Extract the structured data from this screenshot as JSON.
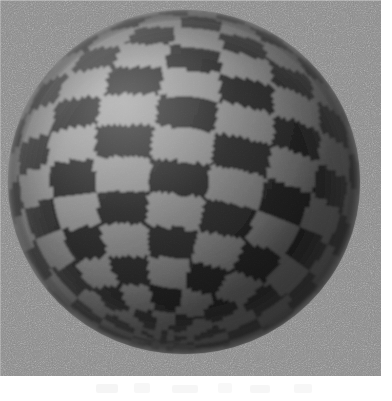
{
  "figure": {
    "media": "grayscale-raster",
    "width_px": 392,
    "height_px": 401
  },
  "plate": {
    "name": "image-plate",
    "left_px": 0,
    "top_px": 0,
    "width_px": 381,
    "height_px": 376,
    "background_color": "#949494",
    "noise": "fine film grain",
    "noise_amplitude": 0.34
  },
  "sphere": {
    "name": "checkerboard-sphere",
    "center_x_px": 184,
    "center_y_px": 182,
    "radius_x_px": 176,
    "radius_y_px": 172,
    "silhouette_color": "#6e6e6e",
    "checker": {
      "type": "spherical-checkerboard",
      "meridian_bands": 18,
      "parallel_bands": 16,
      "dark_color": "#1d1d1d",
      "light_color": "#a6a6a6",
      "mid_color": "#5e5e5e"
    },
    "pole_direction": "upper-left",
    "pole_offset_x_px": -62,
    "pole_offset_y_px": -58,
    "shading": {
      "type": "lambert-diffuse",
      "light_direction": "upper-left",
      "ambient": 0.42,
      "terminator_darkening": 0.55,
      "rim_shadow_color": "#3a3a3a"
    }
  },
  "margins": {
    "right": {
      "name": "margin-right",
      "width_px": 11,
      "color": "#ffffff"
    },
    "bottom": {
      "name": "margin-bottom",
      "height_px": 25,
      "color": "#ffffff"
    }
  },
  "colors": {
    "background_gray": "#949494",
    "checker_dark": "#1d1d1d",
    "checker_light": "#a6a6a6",
    "paper_white": "#ffffff"
  }
}
